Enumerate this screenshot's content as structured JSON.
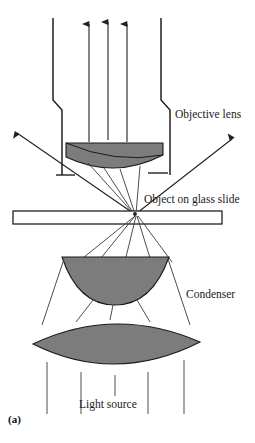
{
  "figure": {
    "caption": "(a)",
    "background_color": "#ffffff",
    "line_color": "#231f20",
    "lens_fill_color": "#7c7c7c",
    "lens_stroke_color": "#1a1a1a"
  },
  "labels": {
    "objective_lens": "Objective lens",
    "object_on_glass_slide": "Object on glass slide",
    "condenser": "Condenser",
    "light_source": "Light source"
  },
  "components": {
    "objective_barrel": {
      "name": "objective-barrel",
      "description": "tube with stepped shoulder narrowing toward the specimen"
    },
    "objective_lens_element": {
      "name": "objective-lens-element",
      "shape": "plano-convex",
      "flat_side": "top"
    },
    "glass_slide": {
      "name": "glass-slide",
      "shape": "thin horizontal rectangle",
      "fill": "none"
    },
    "specimen_point": {
      "name": "specimen-point",
      "description": "focal point on the slide where rays converge and diverge"
    },
    "condenser_upper_lens": {
      "name": "condenser-upper-lens",
      "shape": "plano-convex half-disc",
      "flat_side": "top"
    },
    "condenser_lower_lens": {
      "name": "condenser-lower-lens",
      "shape": "biconvex"
    }
  },
  "rays": {
    "emergent_vertical_count": 3,
    "emergent_vertical_direction": "up",
    "scattered_diagonal_count": 2,
    "scattered_diagonal_direction": "up-outward",
    "illumination_parallel_count": 5,
    "illumination_direction": "up from light source"
  }
}
